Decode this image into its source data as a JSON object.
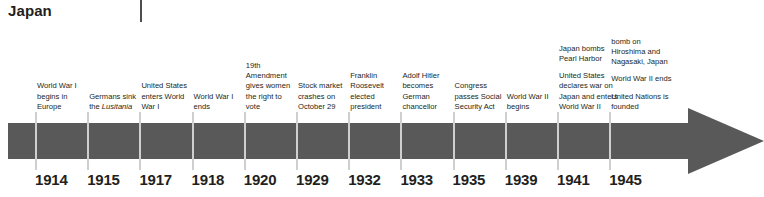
{
  "header": {
    "title": "Japan"
  },
  "timeline": {
    "arrow_color": "#595959",
    "tick_color": "#cfcfcf",
    "columns": [
      {
        "year": "1914",
        "events": [
          "World War I begins in Europe"
        ]
      },
      {
        "year": "1915",
        "events": [
          "Germans sink the Lusitania"
        ],
        "italic_part": "Lusitania"
      },
      {
        "year": "1917",
        "events": [
          "United States enters World War I"
        ]
      },
      {
        "year": "1918",
        "events": [
          "World War I ends"
        ]
      },
      {
        "year": "1920",
        "events": [
          "19th Amendment gives women the right to vote"
        ]
      },
      {
        "year": "1929",
        "events": [
          "Stock market crashes on October 29"
        ]
      },
      {
        "year": "1932",
        "events": [
          "Franklin Roosevelt elected president"
        ]
      },
      {
        "year": "1933",
        "events": [
          "Adolf Hitler becomes German chancellor"
        ]
      },
      {
        "year": "1935",
        "events": [
          "Congress passes Social Security Act"
        ]
      },
      {
        "year": "1939",
        "events": [
          "World War II begins"
        ]
      },
      {
        "year": "1941",
        "events": [
          "Japan bombs Pearl Harbor",
          "United States declares war on Japan and enters World War II"
        ]
      },
      {
        "year": "1945",
        "events": [
          "bomb on Hiroshima and Nagasaki, Japan",
          "World War II ends",
          "United Nations is founded"
        ]
      }
    ]
  }
}
